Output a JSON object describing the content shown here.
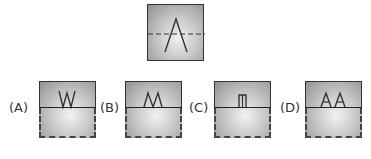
{
  "question": {
    "figure": {
      "symbol": "A",
      "description": "letter A with dashed horizontal fold line"
    }
  },
  "options": [
    {
      "label": "(A)",
      "glyph": "W"
    },
    {
      "label": "(B)",
      "glyph": "M"
    },
    {
      "label": "(C)",
      "glyph": "Π"
    },
    {
      "label": "(D)",
      "glyph": "AA"
    }
  ],
  "colors": {
    "line": "#333333",
    "box_edge": "#8f8f8f",
    "box_center": "#f2f2f2"
  }
}
